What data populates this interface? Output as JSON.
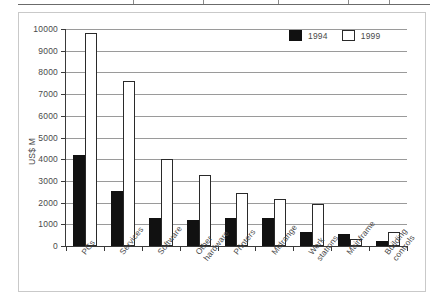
{
  "table_fragment": {
    "name": "table-bottom-edge",
    "column_separator_positions_pct": [
      0,
      28,
      45,
      63,
      80,
      90
    ]
  },
  "legend": {
    "position": "top-right",
    "items": [
      {
        "label": "1994",
        "swatch": "filled-black-square",
        "color": "#111111"
      },
      {
        "label": "1999",
        "swatch": "outlined-white-square",
        "color": "#ffffff"
      }
    ]
  },
  "chart_data": {
    "type": "bar",
    "title": "",
    "subtitle": "",
    "xlabel": "",
    "ylabel": "US$ M",
    "ylim": [
      0,
      10000
    ],
    "ytick_step": 1000,
    "yticks": [
      0,
      1000,
      2000,
      3000,
      4000,
      5000,
      6000,
      7000,
      8000,
      9000,
      10000
    ],
    "ytick_labels": [
      "0",
      "1000",
      "2000",
      "3000",
      "4000",
      "5000",
      "6000",
      "7000",
      "8000",
      "9000",
      "10000"
    ],
    "grid": true,
    "grid_axis": "y",
    "legend_position": "upper right",
    "categories": [
      "PCs",
      "Services",
      "Software",
      "Other hardware",
      "Printers",
      "Midrange",
      "Work stations",
      "Mainframe",
      "Building controls"
    ],
    "category_lines": [
      [
        "PCs"
      ],
      [
        "Services"
      ],
      [
        "Software"
      ],
      [
        "Other",
        "hardware"
      ],
      [
        "Printers"
      ],
      [
        "Midrange"
      ],
      [
        "Work",
        "stations"
      ],
      [
        "Mainframe"
      ],
      [
        "Building",
        "controls"
      ]
    ],
    "series": [
      {
        "name": "1994",
        "color": "#111111",
        "values": [
          4200,
          2550,
          1300,
          1180,
          1280,
          1270,
          650,
          560,
          250
        ]
      },
      {
        "name": "1999",
        "color": "#ffffff",
        "values": [
          9800,
          7600,
          4000,
          3250,
          2450,
          2150,
          1950,
          310,
          640
        ]
      }
    ]
  }
}
